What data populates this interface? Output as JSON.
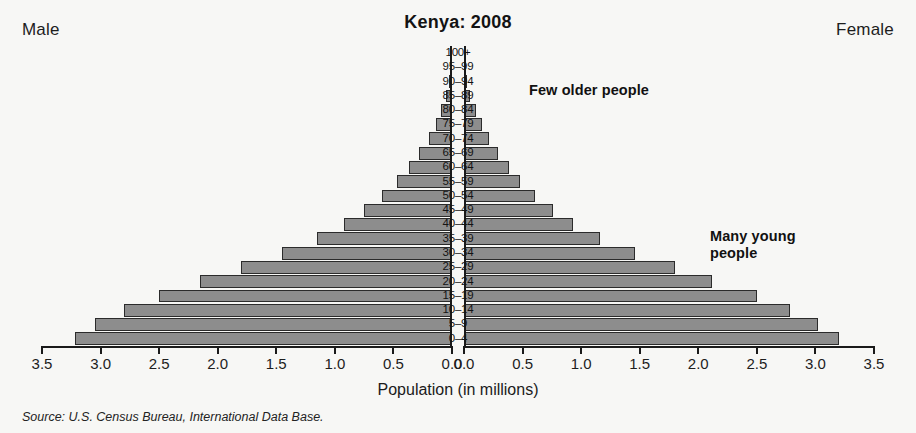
{
  "header": {
    "male_label": "Male",
    "female_label": "Female",
    "title": "Kenya: 2008"
  },
  "annotations": {
    "older": "Few older people",
    "younger_line1": "Many young",
    "younger_line2": "people"
  },
  "source": "Source: U.S. Census Bureau, International Data Base.",
  "colors": {
    "bar_fill": "#8d8d8d",
    "bar_stroke": "#2b2b2b",
    "background": "#f7f7f5",
    "text": "#1a1a1a"
  },
  "chart_data": {
    "type": "bar",
    "title": "Kenya: 2008",
    "subtitle": "",
    "xlabel": "Population (in millions)",
    "ylabel": "",
    "orientation": "horizontal",
    "layout": "population-pyramid",
    "grid": false,
    "legend": "none",
    "xlim_left": [
      3.5,
      0.0
    ],
    "xlim_right": [
      0.0,
      3.5
    ],
    "xticks_left": [
      "3.5",
      "3.0",
      "2.5",
      "2.0",
      "1.5",
      "1.0",
      "0.5",
      "0.0"
    ],
    "xticks_right": [
      "0.0",
      "0.5",
      "1.0",
      "1.5",
      "2.0",
      "2.5",
      "3.0",
      "3.5"
    ],
    "tick_values": [
      3.5,
      3.0,
      2.5,
      2.0,
      1.5,
      1.0,
      0.5,
      0.0
    ],
    "categories": [
      "100+",
      "95–99",
      "90–94",
      "85–89",
      "80–84",
      "75–79",
      "70–74",
      "65–69",
      "60–64",
      "55–59",
      "50–54",
      "45–49",
      "40–44",
      "35–39",
      "30–34",
      "25–29",
      "20–24",
      "15–19",
      "10–14",
      "5–9",
      "0–4"
    ],
    "series": [
      {
        "name": "Male",
        "side": "left",
        "values": [
          0.005,
          0.012,
          0.025,
          0.05,
          0.09,
          0.14,
          0.2,
          0.28,
          0.37,
          0.47,
          0.6,
          0.75,
          0.92,
          1.15,
          1.45,
          1.8,
          2.15,
          2.5,
          2.8,
          3.05,
          3.22
        ]
      },
      {
        "name": "Female",
        "side": "right",
        "values": [
          0.005,
          0.014,
          0.028,
          0.055,
          0.1,
          0.15,
          0.21,
          0.29,
          0.38,
          0.48,
          0.61,
          0.76,
          0.93,
          1.16,
          1.46,
          1.8,
          2.12,
          2.5,
          2.78,
          3.02,
          3.2
        ]
      }
    ]
  }
}
